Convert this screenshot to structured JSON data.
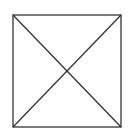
{
  "diagram": {
    "shape": "square-with-diagonals",
    "stroke_color": "#333333",
    "background_color": "#ffffff",
    "box": {
      "x1": 13,
      "y1": 15,
      "x2": 121,
      "y2": 127
    },
    "stroke_width": 1.3
  }
}
